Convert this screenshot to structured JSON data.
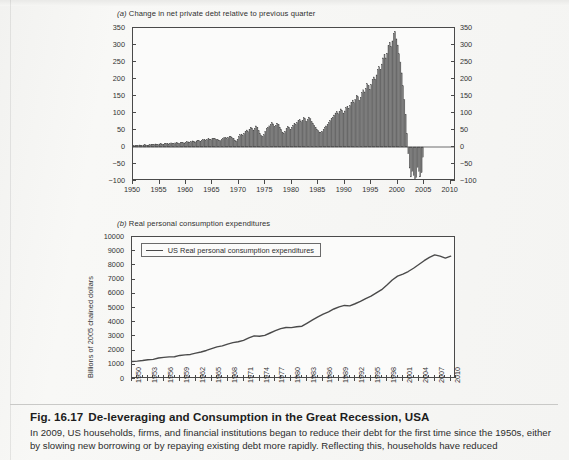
{
  "figure": {
    "number": "Fig. 16.17",
    "title": "De-leveraging and Consumption in the Great Recession, USA",
    "body": "In 2009, US households, firms, and financial institutions began to reduce their debt for the first time since the 1950s, either by slowing new borrowing or by repaying existing debt more rapidly. Reflecting this, households have reduced"
  },
  "panel_a": {
    "title_prefix": "(a)",
    "title": "Change in net private debt relative to previous quarter"
  },
  "panel_b": {
    "title_prefix": "(b)",
    "title": "Real personal consumption expenditures",
    "legend_label": "US Real personal consumption expenditures",
    "ylabel": "Billions of 2005 chained dollars"
  },
  "colors": {
    "bar_fill": "#6f6f6f",
    "bar_stroke": "#4a4a4a",
    "line": "#4a4a4a",
    "axis": "#4a4a4a",
    "paper": "#f6f6f4",
    "plot_bg": "#fbfbfa",
    "text": "#2b2b2b"
  },
  "chart_data": [
    {
      "type": "bar",
      "title": "(a) Change in net private debt relative to previous quarter",
      "xlabel": "",
      "ylabel": "",
      "ylim": [
        -100,
        350
      ],
      "yticks": [
        -100,
        -50,
        0,
        50,
        100,
        150,
        200,
        250,
        300,
        350
      ],
      "xlim": [
        1950,
        2011
      ],
      "xticks": [
        1950,
        1955,
        1960,
        1965,
        1970,
        1975,
        1980,
        1985,
        1990,
        1995,
        2000,
        2005,
        2010
      ],
      "xtick_labels": [
        "1950",
        "1955",
        "1960",
        "1965",
        "1970",
        "1975",
        "1980",
        "1985",
        "1990",
        "1995",
        "2000",
        "2005",
        "2010"
      ],
      "grid": false,
      "dual_y_axis": true,
      "frequency": "quarterly",
      "x_start": 1950.0,
      "x_step": 0.25,
      "values": [
        3,
        4,
        5,
        4,
        5,
        6,
        5,
        4,
        6,
        7,
        6,
        5,
        6,
        7,
        8,
        7,
        8,
        9,
        8,
        7,
        9,
        10,
        9,
        8,
        10,
        11,
        10,
        9,
        11,
        12,
        11,
        10,
        12,
        13,
        12,
        11,
        13,
        14,
        13,
        12,
        14,
        16,
        15,
        13,
        16,
        18,
        17,
        15,
        18,
        20,
        19,
        17,
        20,
        22,
        21,
        19,
        22,
        24,
        23,
        21,
        24,
        26,
        25,
        23,
        22,
        20,
        19,
        21,
        25,
        28,
        27,
        24,
        28,
        31,
        30,
        27,
        24,
        20,
        18,
        22,
        30,
        36,
        38,
        34,
        40,
        46,
        50,
        45,
        52,
        58,
        56,
        50,
        55,
        62,
        58,
        48,
        40,
        34,
        30,
        36,
        46,
        54,
        58,
        62,
        66,
        72,
        68,
        60,
        64,
        70,
        66,
        58,
        52,
        44,
        40,
        46,
        54,
        60,
        58,
        52,
        58,
        64,
        70,
        66,
        72,
        78,
        80,
        74,
        78,
        86,
        84,
        76,
        80,
        88,
        84,
        74,
        70,
        64,
        58,
        52,
        48,
        44,
        42,
        46,
        52,
        58,
        62,
        66,
        72,
        78,
        84,
        88,
        94,
        100,
        104,
        98,
        104,
        112,
        108,
        100,
        106,
        116,
        120,
        114,
        122,
        132,
        138,
        130,
        140,
        152,
        148,
        138,
        146,
        160,
        168,
        162,
        172,
        186,
        180,
        170,
        184,
        198,
        206,
        200,
        212,
        228,
        236,
        228,
        244,
        262,
        272,
        262,
        276,
        298,
        308,
        296,
        312,
        334,
        340,
        318,
        300,
        274,
        250,
        218,
        180,
        140,
        96,
        40,
        -20,
        -62,
        -88,
        -72,
        -84,
        -96,
        -90,
        -60,
        -72,
        -88,
        -76,
        -30
      ]
    },
    {
      "type": "line",
      "title": "(b) Real personal consumption expenditures",
      "series_name": "US Real personal consumption expenditures",
      "xlabel": "",
      "ylabel": "Billions of 2005 chained dollars",
      "ylim": [
        0,
        10000
      ],
      "yticks": [
        0,
        1000,
        2000,
        3000,
        4000,
        5000,
        6000,
        7000,
        8000,
        9000,
        10000
      ],
      "xlim": [
        1950,
        2011
      ],
      "xticks": [
        1950,
        1953,
        1956,
        1959,
        1962,
        1965,
        1968,
        1971,
        1974,
        1977,
        1980,
        1983,
        1986,
        1989,
        1992,
        1995,
        1998,
        2001,
        2004,
        2007,
        2010
      ],
      "xtick_labels": [
        "1950",
        "1953",
        "1956",
        "1959",
        "1962",
        "1965",
        "1968",
        "1971",
        "1974",
        "1977",
        "1980",
        "1983",
        "1986",
        "1989",
        "1992",
        "1995",
        "1998",
        "2001",
        "2004",
        "2007",
        "2010"
      ],
      "grid": false,
      "legend_position": "top-left",
      "x_start": 1950,
      "x_step": 1,
      "x": [
        1950,
        1951,
        1952,
        1953,
        1954,
        1955,
        1956,
        1957,
        1958,
        1959,
        1960,
        1961,
        1962,
        1963,
        1964,
        1965,
        1966,
        1967,
        1968,
        1969,
        1970,
        1971,
        1972,
        1973,
        1974,
        1975,
        1976,
        1977,
        1978,
        1979,
        1980,
        1981,
        1982,
        1983,
        1984,
        1985,
        1986,
        1987,
        1988,
        1989,
        1990,
        1991,
        1992,
        1993,
        1994,
        1995,
        1996,
        1997,
        1998,
        1999,
        2000,
        2001,
        2002,
        2003,
        2004,
        2005,
        2006,
        2007,
        2008,
        2009,
        2010
      ],
      "values": [
        1230,
        1260,
        1300,
        1360,
        1380,
        1480,
        1520,
        1560,
        1570,
        1660,
        1700,
        1730,
        1820,
        1900,
        2010,
        2140,
        2260,
        2330,
        2460,
        2560,
        2620,
        2720,
        2890,
        3040,
        3010,
        3070,
        3240,
        3400,
        3550,
        3630,
        3620,
        3680,
        3720,
        3940,
        4160,
        4380,
        4570,
        4730,
        4930,
        5080,
        5180,
        5150,
        5300,
        5460,
        5660,
        5830,
        6060,
        6290,
        6620,
        6970,
        7240,
        7390,
        7570,
        7800,
        8060,
        8330,
        8570,
        8740,
        8650,
        8510,
        8650
      ]
    }
  ]
}
